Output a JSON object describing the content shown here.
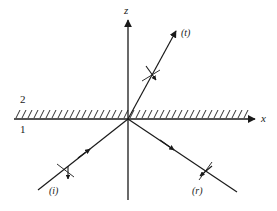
{
  "figure": {
    "type": "optics-ray-diagram",
    "background_color": "#ffffff",
    "line_color": "#1a1a1a"
  },
  "axes": {
    "z_label": "z",
    "x_label": "x",
    "origin": {
      "x": 128,
      "y": 119
    },
    "z_axis": {
      "x": 128,
      "top_y": 18,
      "bottom_y": 200,
      "arrow_at": "top"
    },
    "x_axis": {
      "y": 119,
      "left_x": 14,
      "right_x": 257,
      "arrow_at": "right"
    }
  },
  "media": {
    "upper_label": "2",
    "lower_label": "1",
    "upper_label_pos": {
      "x": 20,
      "y": 94
    },
    "lower_label_pos": {
      "x": 20,
      "y": 124
    },
    "interface": {
      "hatch_start_x": 14,
      "hatch_end_x": 250,
      "hatch_height": 9,
      "hatch_spacing": 6,
      "hatch_slant": 4
    }
  },
  "rays": [
    {
      "name": "incident",
      "label": "(i)",
      "label_pos": {
        "x": 49,
        "y": 186
      },
      "start": {
        "x": 38,
        "y": 190
      },
      "end": {
        "x": 128,
        "y": 119
      },
      "arrow_at_fraction": 0.52,
      "arrow_direction": "toward-origin",
      "tick_at_fraction": 0.37,
      "tick_arrow": "down"
    },
    {
      "name": "reflected",
      "label": "(r)",
      "label_pos": {
        "x": 192,
        "y": 186
      },
      "start": {
        "x": 128,
        "y": 119
      },
      "end": {
        "x": 237,
        "y": 192
      },
      "arrow_at_fraction": 0.45,
      "arrow_direction": "away-from-origin",
      "tick_at_fraction": 0.72,
      "tick_arrow": "down-left"
    },
    {
      "name": "transmitted",
      "label": "(t)",
      "label_pos": {
        "x": 181,
        "y": 28
      },
      "start": {
        "x": 128,
        "y": 119
      },
      "end": {
        "x": 176,
        "y": 31
      },
      "arrow_at_fraction": 0.48,
      "arrow_direction": "away-from-origin",
      "tick_at_fraction": 0.46,
      "tick_arrow": "down-right"
    }
  ]
}
